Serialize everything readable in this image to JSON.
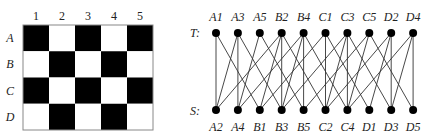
{
  "grid": {
    "columns": [
      "1",
      "2",
      "3",
      "4",
      "5"
    ],
    "rows": [
      "A",
      "B",
      "C",
      "D"
    ],
    "cells": [
      [
        "black",
        "white",
        "black",
        "white",
        "black"
      ],
      [
        "white",
        "black",
        "white",
        "black",
        "white"
      ],
      [
        "black",
        "white",
        "black",
        "white",
        "black"
      ],
      [
        "white",
        "black",
        "white",
        "black",
        "white"
      ]
    ],
    "colors": {
      "black": "#000000",
      "white": "#ffffff",
      "border": "#888888"
    }
  },
  "graph": {
    "top_label": "T:",
    "bottom_label": "S:",
    "top_nodes": [
      "A1",
      "A3",
      "A5",
      "B2",
      "B4",
      "C1",
      "C3",
      "C5",
      "D2",
      "D4"
    ],
    "bottom_nodes": [
      "A2",
      "A4",
      "B1",
      "B3",
      "B5",
      "C2",
      "C4",
      "D1",
      "D3",
      "D5"
    ],
    "edges": [
      [
        "A1",
        "A2"
      ],
      [
        "A1",
        "B1"
      ],
      [
        "A3",
        "A2"
      ],
      [
        "A3",
        "A4"
      ],
      [
        "A3",
        "B3"
      ],
      [
        "A5",
        "A4"
      ],
      [
        "A5",
        "B5"
      ],
      [
        "B2",
        "A2"
      ],
      [
        "B2",
        "B1"
      ],
      [
        "B2",
        "B3"
      ],
      [
        "B2",
        "C2"
      ],
      [
        "B4",
        "A4"
      ],
      [
        "B4",
        "B3"
      ],
      [
        "B4",
        "B5"
      ],
      [
        "B4",
        "C4"
      ],
      [
        "C1",
        "B1"
      ],
      [
        "C1",
        "C2"
      ],
      [
        "C1",
        "D1"
      ],
      [
        "C3",
        "B3"
      ],
      [
        "C3",
        "C2"
      ],
      [
        "C3",
        "C4"
      ],
      [
        "C3",
        "D3"
      ],
      [
        "C5",
        "B5"
      ],
      [
        "C5",
        "C4"
      ],
      [
        "C5",
        "D5"
      ],
      [
        "D2",
        "C2"
      ],
      [
        "D2",
        "D1"
      ],
      [
        "D2",
        "D3"
      ],
      [
        "D4",
        "C4"
      ],
      [
        "D4",
        "D3"
      ],
      [
        "D4",
        "D5"
      ]
    ],
    "node_color": "#000000",
    "edge_color": "#333333"
  }
}
